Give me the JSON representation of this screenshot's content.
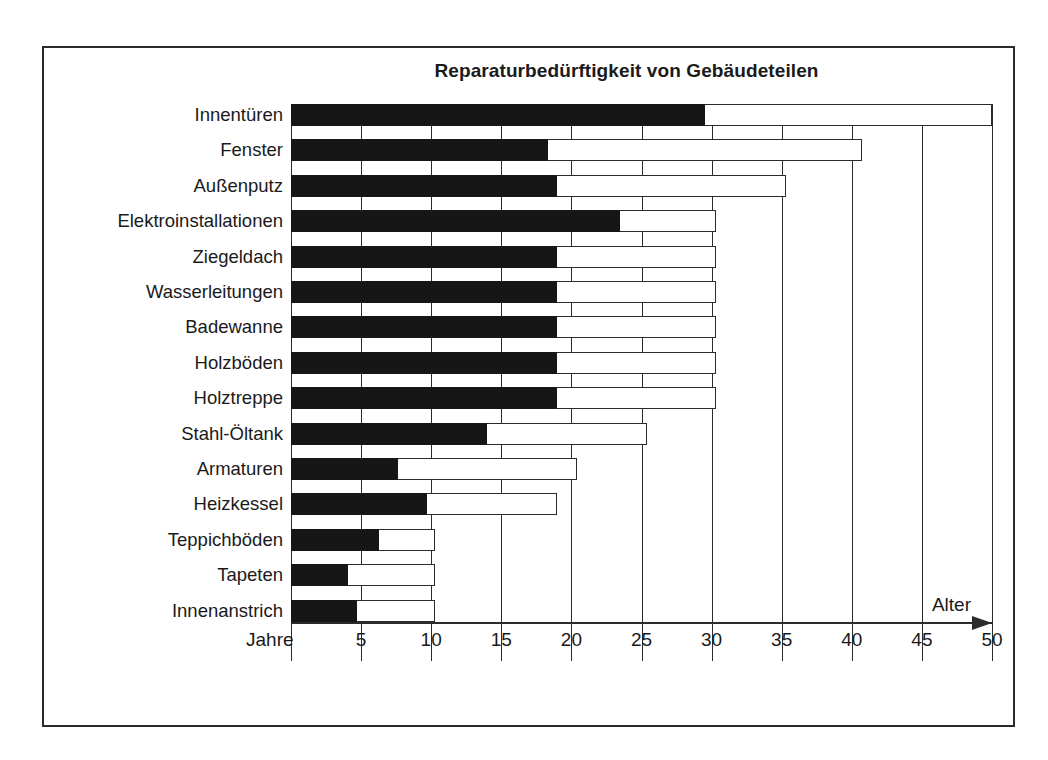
{
  "chart_data": {
    "type": "bar",
    "title": "Reparaturbedürftigkeit von Gebäudeteilen",
    "subtitle": "",
    "orientation": "horizontal",
    "stacked": true,
    "xlabel": "Alter",
    "xunit_label": "Jahre",
    "ylabel": "",
    "xlim": [
      0,
      50
    ],
    "xticks": [
      0,
      5,
      10,
      15,
      20,
      25,
      30,
      35,
      40,
      45,
      50
    ],
    "xtick_labels": [
      "",
      "5",
      "10",
      "15",
      "20",
      "25",
      "30",
      "35",
      "40",
      "45",
      "50"
    ],
    "grid": true,
    "legend_position": "none",
    "colors": {
      "segment_min": "#161616",
      "segment_max": "#ffffff",
      "line": "#2b2b2b",
      "text": "#1a1a1a",
      "background": "#ffffff"
    },
    "series": [
      {
        "name": "Mindestalter bis Reparaturbedarf",
        "values": [
          29.5,
          18.3,
          19.0,
          23.5,
          19.0,
          19.0,
          19.0,
          19.0,
          19.0,
          14.0,
          7.6,
          9.7,
          6.3,
          4.1,
          4.7
        ]
      },
      {
        "name": "Höchstalter bis Reparaturbedarf",
        "values": [
          50.0,
          40.7,
          35.3,
          30.3,
          30.3,
          30.3,
          30.3,
          30.3,
          30.3,
          25.4,
          20.4,
          19.0,
          10.3,
          10.3,
          10.3
        ]
      }
    ],
    "categories": [
      "Innentüren",
      "Fenster",
      "Außenputz",
      "Elektroinstallationen",
      "Ziegeldach",
      "Wasserleitungen",
      "Badewanne",
      "Holzböden",
      "Holztreppe",
      "Stahl-Öltank",
      "Armaturen",
      "Heizkessel",
      "Teppichböden",
      "Tapeten",
      "Innenanstrich"
    ]
  }
}
